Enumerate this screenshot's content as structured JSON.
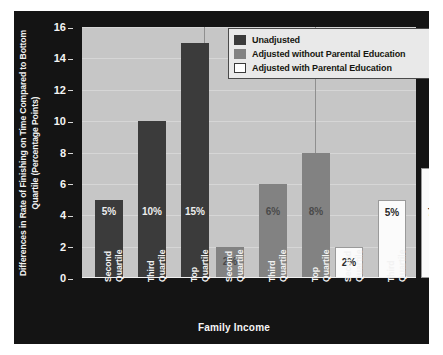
{
  "chart_data": {
    "type": "bar",
    "title": "",
    "xlabel": "Family Income",
    "ylabel": "Differences in Rate of Finishing on Time Compared to Bottom Quartile (Percentage Points)",
    "ylim": [
      0,
      16
    ],
    "yticks": [
      0,
      2,
      4,
      6,
      8,
      10,
      12,
      14,
      16
    ],
    "grid": true,
    "legend_position": "top-right",
    "categories": [
      "Second Quartile",
      "Third Quartile",
      "Top Quartile"
    ],
    "series": [
      {
        "name": "Unadjusted",
        "color": "#3b3b3b",
        "values": [
          5,
          10,
          15
        ],
        "labels": [
          "5%",
          "10%",
          "15%"
        ]
      },
      {
        "name": "Adjusted without Parental Education",
        "color": "#828282",
        "values": [
          2,
          6,
          8
        ],
        "labels": [
          "2%",
          "6%",
          "8%"
        ]
      },
      {
        "name": "Adjusted with Parental Education",
        "color": "#ffffff",
        "values": [
          2,
          5,
          7
        ],
        "labels": [
          "2%",
          "5%",
          "7%"
        ]
      }
    ],
    "bars": [
      {
        "series": 0,
        "category": "Second Quartile",
        "value": 5,
        "label": "5%"
      },
      {
        "series": 0,
        "category": "Third Quartile",
        "value": 10,
        "label": "10%"
      },
      {
        "series": 0,
        "category": "Top Quartile",
        "value": 15,
        "label": "15%"
      },
      {
        "series": 1,
        "category": "Second Quartile",
        "value": 2,
        "label": "2%"
      },
      {
        "series": 1,
        "category": "Third Quartile",
        "value": 6,
        "label": "6%"
      },
      {
        "series": 1,
        "category": "Top Quartile",
        "value": 8,
        "label": "8%"
      },
      {
        "series": 2,
        "category": "Second Quartile",
        "value": 2,
        "label": "2%"
      },
      {
        "series": 2,
        "category": "Third Quartile",
        "value": 5,
        "label": "5%"
      },
      {
        "series": 2,
        "category": "Top Quartile",
        "value": 7,
        "label": "7%"
      }
    ],
    "xtick_labels": [
      {
        "line1": "Second",
        "line2": "Quartile"
      },
      {
        "line1": "Third",
        "line2": "Quartile"
      },
      {
        "line1": "Top",
        "line2": "Quartile"
      },
      {
        "line1": "Second",
        "line2": "Quartile"
      },
      {
        "line1": "Third",
        "line2": "Quartile"
      },
      {
        "line1": "Top",
        "line2": "Quartile"
      },
      {
        "line1": "Second",
        "line2": "Quartile"
      },
      {
        "line1": "Third",
        "line2": "Quartile"
      },
      {
        "line1": "Top",
        "line2": "Quartile"
      }
    ]
  },
  "colors": {
    "figure_background": "#141414",
    "plot_background": "#c6c6c6",
    "gridline": "#d6d6d6",
    "group_separator": "#8f8f8f",
    "axis_text": "#f2f2f2",
    "legend_background": "#e9e9e9",
    "legend_border": "#4a4a4a"
  }
}
